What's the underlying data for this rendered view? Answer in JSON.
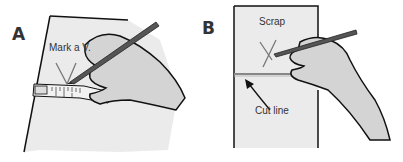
{
  "panels": [
    {
      "id": "A",
      "letter": "A",
      "annotation": "Mark a V.",
      "description": "Hand holding pencil marking a V on fabric edge along a measuring tape"
    },
    {
      "id": "B",
      "letter": "B",
      "annotation_top": "Scrap",
      "annotation_bottom": "Cut line",
      "description": "Hand drawing an X above a horizontal cut line; arrow points to cut line"
    }
  ],
  "colors": {
    "paper": "#ebebeb",
    "hand": "#d4d4d4",
    "outline": "#111111",
    "pencil": "#555555",
    "tape": "#f2f2f2",
    "mark": "#777777"
  }
}
